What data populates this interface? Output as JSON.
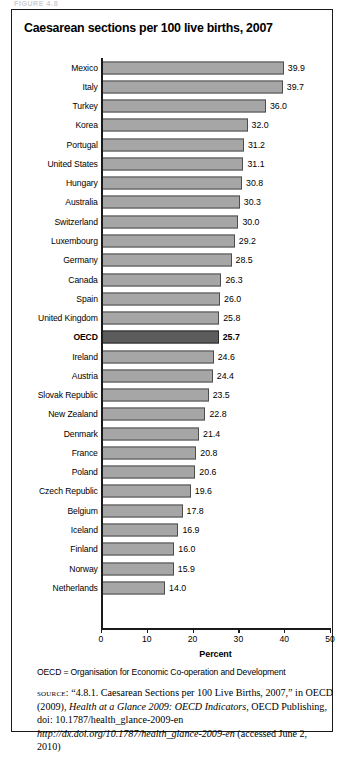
{
  "figure": {
    "kicker": "FIGURE 4.8",
    "title": "Caesarean sections per 100 live births, 2007"
  },
  "notes": {
    "abbreviation": "OECD = Organisation for Economic Co-operation and Development",
    "source_kicker": "source:",
    "source_part1": " “4.8.1. Caesarean Sections per 100 Live Births, 2007,” in OECD (2009), ",
    "source_italic1": "Health at a Glance 2009: OECD Indicators",
    "source_part2": ", OECD Publishing, doi: 10.1787/health_glance-2009-en ",
    "source_italic2": "http://dx.doi.org/10.1787/health_glance-2009-en",
    "source_part3": " (accessed June 2, 2010)"
  },
  "chart_data": {
    "type": "bar",
    "orientation": "horizontal",
    "title": "Caesarean sections per 100 live births, 2007",
    "xlabel": "Percent",
    "ylabel": "",
    "xlim": [
      0,
      50
    ],
    "xticks": [
      0,
      10,
      20,
      30,
      40,
      50
    ],
    "xtick_labels": [
      "0",
      "10",
      "20",
      "30",
      "40",
      "50"
    ],
    "grid": false,
    "legend": false,
    "highlight_category": "OECD",
    "colors": {
      "bar": "#a6a6a6",
      "bar_border": "#4d4d4d",
      "highlight_bar": "#5c5c5c",
      "highlight_bar_border": "#2b2b2b",
      "axis": "#1a1a1a",
      "background": "#ffffff"
    },
    "categories": [
      "Mexico",
      "Italy",
      "Turkey",
      "Korea",
      "Portugal",
      "United States",
      "Hungary",
      "Australia",
      "Switzerland",
      "Luxembourg",
      "Germany",
      "Canada",
      "Spain",
      "United Kingdom",
      "OECD",
      "Ireland",
      "Austria",
      "Slovak Republic",
      "New Zealand",
      "Denmark",
      "France",
      "Poland",
      "Czech Republic",
      "Belgium",
      "Iceland",
      "Finland",
      "Norway",
      "Netherlands"
    ],
    "values": [
      39.9,
      39.7,
      36.0,
      32.0,
      31.2,
      31.1,
      30.8,
      30.3,
      30.0,
      29.2,
      28.5,
      26.3,
      26.0,
      25.8,
      25.7,
      24.6,
      24.4,
      23.5,
      22.8,
      21.4,
      20.8,
      20.6,
      19.6,
      17.8,
      16.9,
      16.0,
      15.9,
      14.0
    ],
    "value_labels": [
      "39.9",
      "39.7",
      "36.0",
      "32.0",
      "31.2",
      "31.1",
      "30.8",
      "30.3",
      "30.0",
      "29.2",
      "28.5",
      "26.3",
      "26.0",
      "25.8",
      "25.7",
      "24.6",
      "24.4",
      "23.5",
      "22.8",
      "21.4",
      "20.8",
      "20.6",
      "19.6",
      "17.8",
      "16.9",
      "16.0",
      "15.9",
      "14.0"
    ]
  }
}
